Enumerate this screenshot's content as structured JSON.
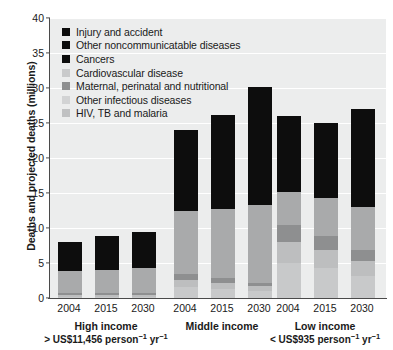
{
  "chart_data": {
    "type": "bar",
    "subtype": "stacked-bar-grouped",
    "title": "",
    "xlabel": "",
    "ylabel": "Deaths and projected deaths (millions)",
    "ylim": [
      0,
      40
    ],
    "yticks": [
      0,
      5,
      10,
      15,
      20,
      25,
      30,
      35,
      40
    ],
    "grid": true,
    "legend_position": "top-left",
    "categories": [
      "2004",
      "2015",
      "2030"
    ],
    "groups": [
      {
        "name": "High income",
        "caption_prefix": ">",
        "caption_value": "US$11,456",
        "caption_units": "person",
        "caption_units2": "yr",
        "totals": [
          8.0,
          8.8,
          9.5
        ]
      },
      {
        "name": "Middle income",
        "caption_prefix": "",
        "caption_value": "",
        "caption_units": "",
        "caption_units2": "",
        "totals": [
          24.0,
          26.2,
          30.2
        ]
      },
      {
        "name": "Low income",
        "caption_prefix": "<",
        "caption_value": "US$935",
        "caption_units": "person",
        "caption_units2": "yr",
        "totals": [
          26.0,
          25.0,
          27.0
        ]
      }
    ],
    "series": [
      {
        "name": "HIV, TB and malaria",
        "color": "#c8c9ca",
        "values": {
          "High income": [
            0.2,
            0.2,
            0.2
          ],
          "Middle income": [
            1.6,
            1.3,
            1.0
          ],
          "Low income": [
            5.0,
            4.3,
            3.2
          ]
        }
      },
      {
        "name": "Other infectious diseases",
        "color": "#bdbebf",
        "values": {
          "High income": [
            0.3,
            0.3,
            0.3
          ],
          "Middle income": [
            1.0,
            0.9,
            0.7
          ],
          "Low income": [
            3.0,
            2.6,
            2.1
          ]
        }
      },
      {
        "name": "Maternal, perinatal and nutritional",
        "color": "#8e8f90",
        "values": {
          "High income": [
            0.15,
            0.15,
            0.15
          ],
          "Middle income": [
            0.8,
            0.6,
            0.4
          ],
          "Low income": [
            2.4,
            2.0,
            1.6
          ]
        }
      },
      {
        "name": "Cardiovascular disease",
        "color": "#a9aaab",
        "values": {
          "High income": [
            3.15,
            3.35,
            3.65
          ],
          "Middle income": [
            9.1,
            9.9,
            11.2
          ],
          "Low income": [
            4.8,
            5.4,
            6.1
          ]
        }
      },
      {
        "name": "Cancers",
        "color": "#0d0d0d",
        "values": {
          "High income": [
            2.1,
            2.3,
            2.5
          ],
          "Middle income": [
            3.6,
            4.2,
            5.3
          ],
          "Low income": [
            1.6,
            1.8,
            2.2
          ]
        }
      },
      {
        "name": "Other noncommunicatable diseases",
        "color": "#0d0d0d",
        "values": {
          "High income": [
            1.5,
            1.7,
            1.9
          ],
          "Middle income": [
            5.1,
            6.3,
            8.0
          ],
          "Low income": [
            5.6,
            5.9,
            7.2
          ]
        }
      },
      {
        "name": "Injury and accident",
        "color": "#0d0d0d",
        "values": {
          "High income": [
            0.6,
            0.8,
            0.8
          ],
          "Middle income": [
            2.8,
            3.0,
            3.6
          ],
          "Low income": [
            3.6,
            3.0,
            4.6
          ]
        }
      }
    ],
    "legend": [
      {
        "label": "Injury and accident",
        "color": "#0d0d0d"
      },
      {
        "label": "Other noncommunicatable diseases",
        "color": "#0d0d0d"
      },
      {
        "label": "Cancers",
        "color": "#0d0d0d"
      },
      {
        "label": "Cardiovascular disease",
        "color": "#c9cacb"
      },
      {
        "label": "Maternal, perinatal and nutritional",
        "color": "#8e8f90"
      },
      {
        "label": "Other infectious diseases",
        "color": "#d2d3d4"
      },
      {
        "label": "HIV, TB and malaria",
        "color": "#c0c1c2"
      }
    ]
  }
}
